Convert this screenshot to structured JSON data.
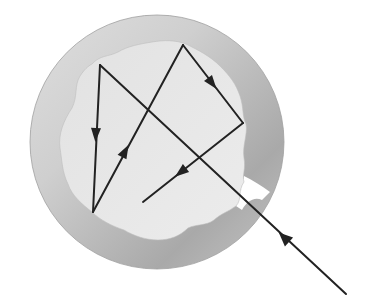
{
  "diagram": {
    "colors": {
      "background": "#ffffff",
      "shell_light": "#d9d9d9",
      "shell_mid": "#bdbdbd",
      "shell_dark": "#a8a8a8",
      "cavity": "#e6e6e6",
      "ray": "#222222"
    },
    "ray_path": [
      {
        "x": 346,
        "y": 294
      },
      {
        "x": 100,
        "y": 65
      },
      {
        "x": 93,
        "y": 212
      },
      {
        "x": 183,
        "y": 45
      },
      {
        "x": 243,
        "y": 123
      },
      {
        "x": 143,
        "y": 202
      }
    ],
    "arrows": [
      {
        "x": 289,
        "y": 242,
        "direction": "up-left"
      },
      {
        "x": 96,
        "y": 135,
        "direction": "down"
      },
      {
        "x": 126,
        "y": 152,
        "direction": "up-right"
      },
      {
        "x": 214,
        "y": 86,
        "direction": "down-right"
      },
      {
        "x": 180,
        "y": 173,
        "direction": "down-left"
      }
    ],
    "hole": {
      "x": 252,
      "y": 187,
      "label": "opening"
    }
  }
}
